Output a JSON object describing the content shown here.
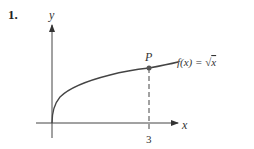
{
  "problem_number": "1.",
  "diagram": {
    "y_axis_label": "y",
    "x_axis_label": "x",
    "point_label": "P",
    "function_label": "f(x) = √x",
    "function_label_parts": {
      "lhs": "f(x) = ",
      "radical": "√",
      "radicand": "x"
    },
    "x_tick_label": "3",
    "point": {
      "x": 3,
      "y": 1.732
    }
  }
}
